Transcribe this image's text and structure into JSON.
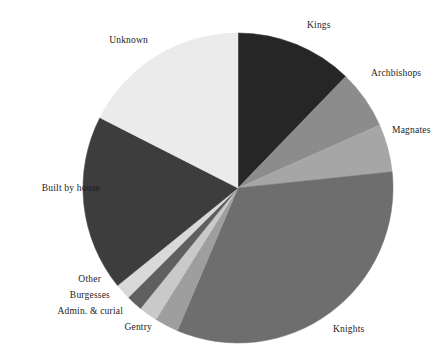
{
  "chart_data": {
    "type": "pie",
    "title": "",
    "subtitle": "",
    "xlabel": "",
    "ylabel": "",
    "legend_position": "none",
    "grid": false,
    "start_angle_deg": 0,
    "direction": "clockwise",
    "center": {
      "x": 238,
      "y": 188
    },
    "radius": 155,
    "categories": [
      "Kings",
      "Archbishops",
      "Magnates",
      "Knights",
      "Gentry",
      "Admin. & curial",
      "Burgesses",
      "Other",
      "Built by house",
      "Unknown"
    ],
    "values": [
      12.2,
      6.1,
      5.0,
      33.1,
      2.5,
      1.9,
      1.7,
      1.7,
      18.3,
      17.5
    ],
    "colors": [
      "#262626",
      "#8c8c8c",
      "#a6a6a6",
      "#6e6e6e",
      "#9e9e9e",
      "#c9c9c9",
      "#5f5f5f",
      "#d9d9d9",
      "#3d3d3d",
      "#ebebeb"
    ],
    "slices": [
      {
        "label": "Kings",
        "value": 12.2,
        "start_deg": 0,
        "end_deg": 44.0,
        "color": "#262626"
      },
      {
        "label": "Archbishops",
        "value": 6.1,
        "start_deg": 44.0,
        "end_deg": 66.0,
        "color": "#8c8c8c"
      },
      {
        "label": "Magnates",
        "value": 5.0,
        "start_deg": 66.0,
        "end_deg": 84.0,
        "color": "#a6a6a6"
      },
      {
        "label": "Knights",
        "value": 33.1,
        "start_deg": 84.0,
        "end_deg": 203.0,
        "color": "#6e6e6e"
      },
      {
        "label": "Gentry",
        "value": 2.5,
        "start_deg": 203.0,
        "end_deg": 212.0,
        "color": "#9e9e9e"
      },
      {
        "label": "Admin. & curial",
        "value": 1.9,
        "start_deg": 212.0,
        "end_deg": 219.0,
        "color": "#c9c9c9"
      },
      {
        "label": "Burgesses",
        "value": 1.7,
        "start_deg": 219.0,
        "end_deg": 225.0,
        "color": "#5f5f5f"
      },
      {
        "label": "Other",
        "value": 1.7,
        "start_deg": 225.0,
        "end_deg": 231.0,
        "color": "#d9d9d9"
      },
      {
        "label": "Built by house",
        "value": 18.3,
        "start_deg": 231.0,
        "end_deg": 297.0,
        "color": "#3d3d3d"
      },
      {
        "label": "Unknown",
        "value": 17.5,
        "start_deg": 297.0,
        "end_deg": 360.0,
        "color": "#ebebeb"
      }
    ]
  },
  "labels": {
    "kings": "Kings",
    "archbishops": "Archbishops",
    "magnates": "Magnates",
    "knights": "Knights",
    "gentry": "Gentry",
    "admin_curial": "Admin. & curial",
    "burgesses": "Burgesses",
    "other": "Other",
    "built_by_house": "Built by house",
    "unknown": "Unknown"
  },
  "label_positions": [
    {
      "key": "kings",
      "x": 307,
      "y": 26,
      "align": "left"
    },
    {
      "key": "archbishops",
      "x": 371,
      "y": 74,
      "align": "left"
    },
    {
      "key": "magnates",
      "x": 392,
      "y": 131,
      "align": "left"
    },
    {
      "key": "knights",
      "x": 333,
      "y": 330,
      "align": "left"
    },
    {
      "key": "gentry",
      "x": 152,
      "y": 328,
      "align": "right"
    },
    {
      "key": "admin_curial",
      "x": 123,
      "y": 312,
      "align": "right"
    },
    {
      "key": "burgesses",
      "x": 110,
      "y": 296,
      "align": "right"
    },
    {
      "key": "other",
      "x": 101,
      "y": 280,
      "align": "right"
    },
    {
      "key": "built_by_house",
      "x": 100,
      "y": 189,
      "align": "right"
    },
    {
      "key": "unknown",
      "x": 148,
      "y": 41,
      "align": "right"
    }
  ],
  "background_color": "#ffffff",
  "label_color": "#1a1a1a"
}
